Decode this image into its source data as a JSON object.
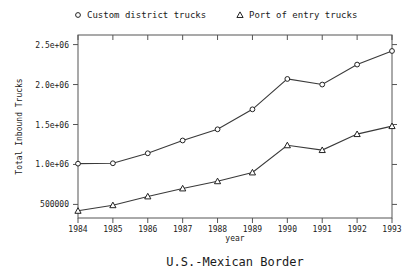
{
  "chart_data": {
    "type": "line",
    "title": "U.S.-Mexican Border",
    "xlabel": "year",
    "ylabel": "Total Inbound Trucks",
    "x": [
      1984,
      1985,
      1986,
      1987,
      1988,
      1989,
      1990,
      1991,
      1992,
      1993
    ],
    "xtick_labels": [
      "1984",
      "1985",
      "1986",
      "1987",
      "1988",
      "1989",
      "1990",
      "1991",
      "1992",
      "1993"
    ],
    "ytick_values": [
      500000,
      1000000,
      1500000,
      2000000,
      2500000
    ],
    "ytick_labels": [
      "500000",
      "1.0e+06",
      "1.5e+06",
      "2.0e+06",
      "2.5e+06"
    ],
    "xlim": [
      1984,
      1993
    ],
    "ylim": [
      330000,
      2620000
    ],
    "grid": false,
    "legend_position": "top",
    "series": [
      {
        "name": "Custom district trucks",
        "marker": "circle",
        "values": [
          1010000,
          1015000,
          1140000,
          1300000,
          1440000,
          1690000,
          2070000,
          2000000,
          2250000,
          2420000
        ]
      },
      {
        "name": "Port of entry trucks",
        "marker": "triangle",
        "values": [
          420000,
          490000,
          600000,
          700000,
          790000,
          900000,
          1240000,
          1180000,
          1380000,
          1480000
        ]
      }
    ]
  }
}
